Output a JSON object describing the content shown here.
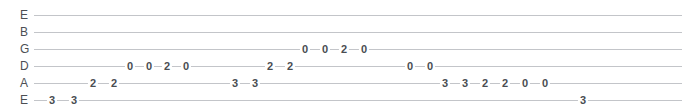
{
  "tab": {
    "width": 686,
    "height": 109,
    "line_color": "#c3c5c9",
    "text_color": "#4a4d52",
    "background": "#ffffff",
    "strings": [
      {
        "label": "E",
        "name": "high-e-string",
        "y": 14,
        "notes": []
      },
      {
        "label": "B",
        "name": "b-string",
        "y": 31,
        "notes": []
      },
      {
        "label": "G",
        "name": "g-string",
        "y": 48,
        "notes": [
          {
            "fret": "0",
            "x": 305
          },
          {
            "fret": "0",
            "x": 325
          },
          {
            "fret": "2",
            "x": 344
          },
          {
            "fret": "0",
            "x": 364
          }
        ]
      },
      {
        "label": "D",
        "name": "d-string",
        "y": 65,
        "notes": [
          {
            "fret": "0",
            "x": 130
          },
          {
            "fret": "0",
            "x": 149
          },
          {
            "fret": "2",
            "x": 167
          },
          {
            "fret": "0",
            "x": 186
          },
          {
            "fret": "2",
            "x": 270
          },
          {
            "fret": "2",
            "x": 290
          },
          {
            "fret": "0",
            "x": 410
          },
          {
            "fret": "0",
            "x": 430
          }
        ]
      },
      {
        "label": "A",
        "name": "a-string",
        "y": 82,
        "notes": [
          {
            "fret": "2",
            "x": 93
          },
          {
            "fret": "2",
            "x": 114
          },
          {
            "fret": "3",
            "x": 235
          },
          {
            "fret": "3",
            "x": 255
          },
          {
            "fret": "3",
            "x": 445
          },
          {
            "fret": "3",
            "x": 465
          },
          {
            "fret": "2",
            "x": 485
          },
          {
            "fret": "2",
            "x": 505
          },
          {
            "fret": "0",
            "x": 525
          },
          {
            "fret": "0",
            "x": 545
          }
        ]
      },
      {
        "label": "E",
        "name": "low-e-string",
        "y": 99,
        "notes": [
          {
            "fret": "3",
            "x": 52
          },
          {
            "fret": "3",
            "x": 74
          },
          {
            "fret": "3",
            "x": 583
          }
        ]
      }
    ]
  }
}
